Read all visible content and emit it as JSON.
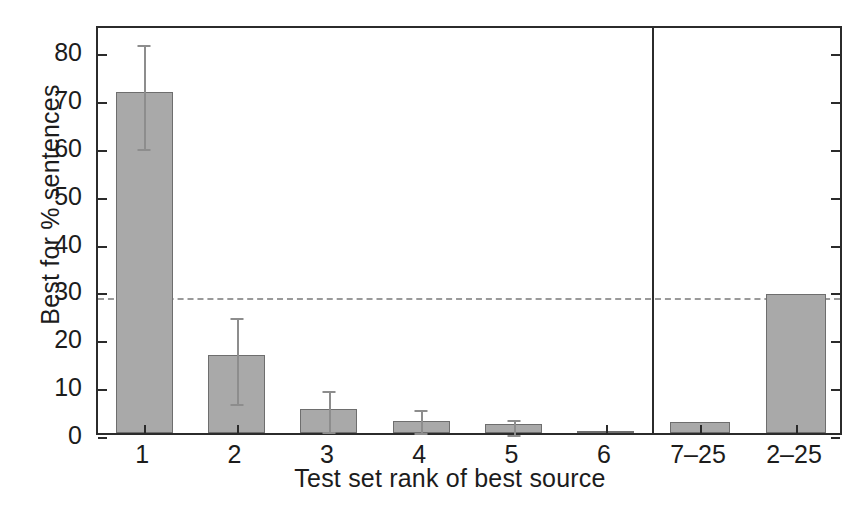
{
  "chart_data": {
    "type": "bar",
    "title": "",
    "xlabel": "Test set rank of best source",
    "ylabel": "Best for % sentences",
    "categories": [
      "1",
      "2",
      "3",
      "4",
      "5",
      "6",
      "7–25",
      "2–25"
    ],
    "values": [
      71.3,
      16.3,
      5.0,
      2.6,
      1.8,
      0.4,
      2.2,
      29.0
    ],
    "errors_low": [
      60.3,
      6.8,
      1.0,
      0.9,
      0.4,
      null,
      null,
      null
    ],
    "errors_high": [
      82.0,
      24.8,
      9.6,
      5.6,
      3.6,
      null,
      null,
      null
    ],
    "ylim": [
      0,
      85.5
    ],
    "yticks": [
      0,
      10,
      20,
      30,
      40,
      50,
      60,
      70,
      80
    ],
    "ytick_labels": [
      "0",
      "10",
      "20",
      "30",
      "40",
      "50",
      "60",
      "70",
      "80"
    ],
    "reference_line": 29.0,
    "reference_line_style": "dashed",
    "panel_separator_after_category": "6",
    "grid": false,
    "legend": null,
    "bar_fill_color": "#a9a9a9",
    "bar_edge_color": "#6e6e6e",
    "error_bar_color": "#8d8d8d",
    "axis_color": "#2b2b2b",
    "reference_line_color": "#9a9a9a",
    "background_color": "#ffffff"
  }
}
